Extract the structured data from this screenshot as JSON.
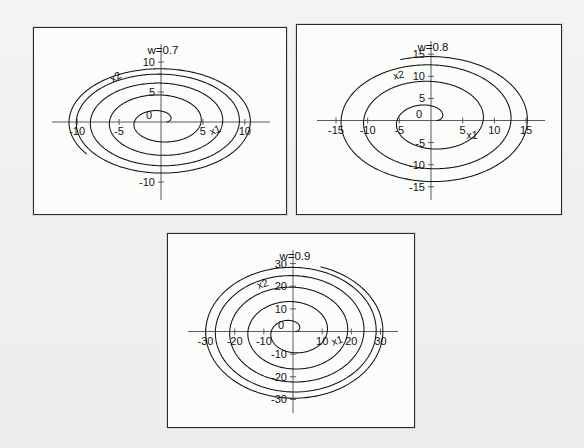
{
  "figure": {
    "background_color": "#f3f2f0",
    "panel_background": "#fcfcfb",
    "line_color": "#111111",
    "axis_color": "#4a4a4a",
    "panel_count": 3
  },
  "chart_data": [
    {
      "type": "line",
      "title": "w=0.7",
      "xlabel": "x1",
      "ylabel": "x2",
      "xlim": [
        -13,
        13
      ],
      "ylim": [
        -13,
        13
      ],
      "grid": false,
      "legend": "none",
      "xticks": [
        -10,
        -5,
        0,
        5,
        10
      ],
      "xticklabels": [
        "-10",
        "-5",
        "0",
        "5",
        "10"
      ],
      "yticks": [
        10,
        5,
        0,
        -10
      ],
      "yticklabels": [
        "10",
        "5",
        "0",
        "-10"
      ],
      "description": "Outward spiral phase trajectory in the x1-x2 plane; starts near the origin with a small inner loop and grows to a maximum radius of about 11 in x1 and 9 in x2.",
      "series": [
        {
          "name": "trajectory w=0.7",
          "kind": "spiral",
          "start_radius_x": 0.7,
          "start_radius_y": 0.6,
          "end_radius_x": 11.0,
          "end_radius_y": 9.0,
          "turns": 4.6,
          "start_angle_deg": 0,
          "direction": "counterclockwise",
          "growth": "accelerating-then-saturating"
        }
      ]
    },
    {
      "type": "line",
      "title": "w=0.8",
      "xlabel": "x1",
      "ylabel": "x2",
      "xlim": [
        -18,
        18
      ],
      "ylim": [
        -18,
        18
      ],
      "grid": false,
      "legend": "none",
      "xticks": [
        -15,
        -10,
        -5,
        0,
        5,
        10,
        15
      ],
      "xticklabels": [
        "-15",
        "-10",
        "-5",
        "0",
        "5",
        "10",
        "15"
      ],
      "yticks": [
        15,
        10,
        5,
        0,
        -5,
        -10,
        -15
      ],
      "yticklabels": [
        "15",
        "10",
        "5",
        "0",
        "-5",
        "-10",
        "-15"
      ],
      "description": "Outward spiral phase trajectory; begins with a tiny loop just right of the origin and expands to about 15.5 in x1 and 14.5 in x2 after roughly three turns.",
      "series": [
        {
          "name": "trajectory w=0.8",
          "kind": "spiral",
          "start_radius_x": 0.9,
          "start_radius_y": 0.8,
          "end_radius_x": 15.5,
          "end_radius_y": 14.5,
          "turns": 3.3,
          "start_angle_deg": 0,
          "direction": "counterclockwise",
          "growth": "accelerating-then-saturating"
        }
      ]
    },
    {
      "type": "line",
      "title": "w=0.9",
      "xlabel": "x1",
      "ylabel": "x2",
      "xlim": [
        -36,
        36
      ],
      "ylim": [
        -36,
        36
      ],
      "grid": false,
      "legend": "none",
      "xticks": [
        -30,
        -20,
        -10,
        0,
        10,
        20,
        30
      ],
      "xticklabels": [
        "-30",
        "-20",
        "-10",
        "0",
        "10",
        "20",
        "30"
      ],
      "yticks": [
        30,
        20,
        10,
        0,
        -10,
        -20,
        -30
      ],
      "yticklabels": [
        "30",
        "20",
        "10",
        "0",
        "-10",
        "-20",
        "-30"
      ],
      "description": "Outward spiral phase trajectory with the largest amplitude of the three; grows from the origin to about 31 in x1 and 30 in x2 over roughly five turns, with the outer turns nearly overlapping.",
      "series": [
        {
          "name": "trajectory w=0.9",
          "kind": "spiral",
          "start_radius_x": 0.8,
          "start_radius_y": 0.7,
          "end_radius_x": 31.0,
          "end_radius_y": 30.0,
          "turns": 5.2,
          "start_angle_deg": 0,
          "direction": "counterclockwise",
          "growth": "accelerating-then-saturating"
        }
      ]
    }
  ]
}
